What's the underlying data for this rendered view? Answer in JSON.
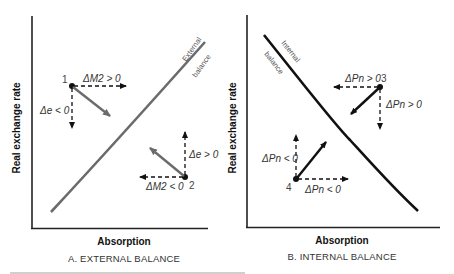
{
  "figure": {
    "y_axis_label": "Real exchange rate",
    "x_axis_label": "Absorption",
    "cut_off_caption": "(partially visible caption line, illegible)"
  },
  "panels": [
    {
      "id": "A",
      "caption": "A. EXTERNAL BALANCE",
      "curve": {
        "label_line1": "External",
        "label_line2": "balance",
        "color": "#6b6b6b",
        "slope": "upward"
      },
      "points": [
        {
          "number": "1",
          "horizontal_label": "ΔM2 > 0",
          "vertical_label": "Δe < 0",
          "horizontal_dir": "right",
          "vertical_dir": "down",
          "resultant_dir": "down-right"
        },
        {
          "number": "2",
          "horizontal_label": "ΔM2 < 0",
          "vertical_label": "Δe > 0",
          "horizontal_dir": "left",
          "vertical_dir": "up",
          "resultant_dir": "up-left"
        }
      ]
    },
    {
      "id": "B",
      "caption": "B. INTERNAL BALANCE",
      "curve": {
        "label_line1": "Internal",
        "label_line2": "balance",
        "color": "#111111",
        "slope": "downward"
      },
      "points": [
        {
          "number": "3",
          "horizontal_label": "ΔPn > 0",
          "vertical_label": "ΔPn > 0",
          "horizontal_dir": "left",
          "vertical_dir": "down",
          "resultant_dir": "down-left"
        },
        {
          "number": "4",
          "horizontal_label": "ΔPn < 0",
          "vertical_label": "ΔPn < 0",
          "horizontal_dir": "right",
          "vertical_dir": "up",
          "resultant_dir": "up-right"
        }
      ]
    }
  ],
  "colors": {
    "axis": "#222222",
    "external_curve": "#6b6b6b",
    "internal_curve": "#111111",
    "dashed_arrow": "#111111",
    "resultant_arrow_A": "#6b6b6b",
    "resultant_arrow_B": "#111111"
  }
}
